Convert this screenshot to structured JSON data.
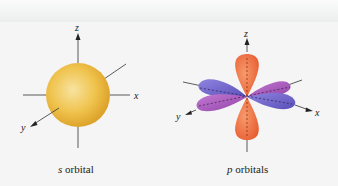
{
  "figure": {
    "panels": [
      {
        "id": "s-orbital",
        "caption_var": "s",
        "caption_text": " orbital",
        "axes": {
          "z": "z",
          "x": "x",
          "y": "y"
        },
        "colors": {
          "sphere_light": "#f6dc8a",
          "sphere_dark": "#e3a82a"
        }
      },
      {
        "id": "p-orbitals",
        "caption_var": "p",
        "caption_text": " orbitals",
        "axes": {
          "z": "z",
          "x": "x",
          "y": "y"
        },
        "colors": {
          "pz": "#ee6a3c",
          "px": "#6f63c9",
          "py": "#a455b8"
        }
      }
    ]
  }
}
